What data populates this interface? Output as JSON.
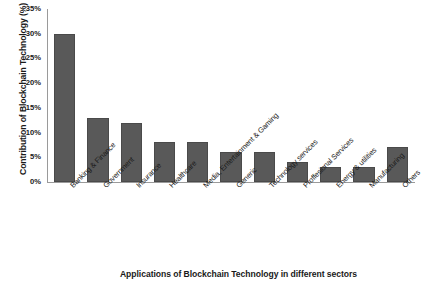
{
  "chart_data": {
    "type": "bar",
    "title": "",
    "xlabel": "Applications of Blockchain Technology in different sectors",
    "ylabel": "Contribution of Blockchain Technology (%)",
    "categories": [
      "Banking & Finance",
      "Government",
      "Insurance",
      "Healthcare",
      "Media, Entertainment & Gaming",
      "Generic",
      "Technology services",
      "Proffesional Services",
      "Energy & utilities",
      "Manufacturing",
      "Others"
    ],
    "values": [
      30,
      13,
      12,
      8,
      8,
      6,
      6,
      4,
      3,
      3,
      7
    ],
    "ylim": [
      0,
      35
    ],
    "ytick_labels": [
      "35%",
      "30%",
      "25%",
      "20%",
      "15%",
      "10%",
      "5%",
      "0%"
    ],
    "ytick_values": [
      35,
      30,
      25,
      20,
      15,
      10,
      5,
      0
    ],
    "grid": false,
    "legend": false,
    "bar_color": "#595959",
    "axis_color": "#9a9a9a",
    "text_color": "#1a1a1a"
  }
}
